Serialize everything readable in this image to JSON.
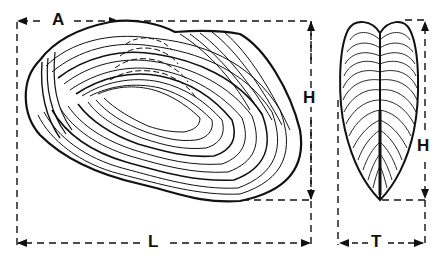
{
  "figure": {
    "colors": {
      "ink": "#111111",
      "background": "#ffffff"
    },
    "lateral_view": {
      "labels": {
        "anterior_to_umbo": "A",
        "height": "H",
        "length": "L"
      }
    },
    "end_view": {
      "labels": {
        "height": "H",
        "thickness": "T"
      }
    }
  }
}
